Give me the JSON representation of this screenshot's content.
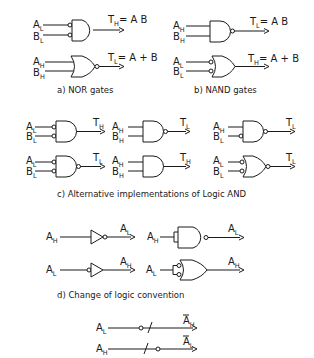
{
  "figure": {
    "sections": {
      "a": {
        "caption": "a)  NOR gates",
        "gates": [
          {
            "type": "AND",
            "inputs": [
              {
                "name": "A",
                "level": "L"
              },
              {
                "name": "B",
                "level": "L"
              }
            ],
            "output": {
              "name": "T",
              "level": "H",
              "expr": "= A B"
            }
          },
          {
            "type": "NOR",
            "inputs": [
              {
                "name": "A",
                "level": "H"
              },
              {
                "name": "B",
                "level": "H"
              }
            ],
            "output": {
              "name": "T",
              "level": "L",
              "expr": "= A + B"
            }
          }
        ]
      },
      "b": {
        "caption": "b)  NAND gates",
        "gates": [
          {
            "type": "NAND",
            "inputs": [
              {
                "name": "A",
                "level": "H"
              },
              {
                "name": "B",
                "level": "H"
              }
            ],
            "output": {
              "name": "T",
              "level": "L",
              "expr": "= A B"
            }
          },
          {
            "type": "OR",
            "inputs": [
              {
                "name": "A",
                "level": "L"
              },
              {
                "name": "B",
                "level": "L"
              }
            ],
            "output": {
              "name": "T",
              "level": "H",
              "expr": "= A + B"
            }
          }
        ]
      },
      "c": {
        "caption": "c)    Alternative implementations of Logic AND",
        "gates": [
          {
            "type": "AND",
            "inputs": [
              {
                "name": "A",
                "level": "L"
              },
              {
                "name": "B",
                "level": "L"
              }
            ],
            "output": {
              "name": "T",
              "level": "H"
            }
          },
          {
            "type": "NAND",
            "inputs": [
              {
                "name": "A",
                "level": "H"
              },
              {
                "name": "B",
                "level": "H"
              }
            ],
            "output": {
              "name": "T",
              "level": "L"
            }
          },
          {
            "type": "NAND",
            "inputs": [
              {
                "name": "A",
                "level": "H"
              },
              {
                "name": "B",
                "level": "L"
              }
            ],
            "output": {
              "name": "T",
              "level": "L"
            }
          },
          {
            "type": "NAND",
            "inputs": [
              {
                "name": "A",
                "level": "L"
              },
              {
                "name": "B",
                "level": "L"
              }
            ],
            "output": {
              "name": "T",
              "level": "L"
            }
          },
          {
            "type": "AND",
            "inputs": [
              {
                "name": "A",
                "level": "H"
              },
              {
                "name": "B",
                "level": "H"
              }
            ],
            "output": {
              "name": "T",
              "level": "H"
            }
          },
          {
            "type": "NOR",
            "inputs": [
              {
                "name": "A",
                "level": "L"
              },
              {
                "name": "B",
                "level": "L"
              }
            ],
            "output": {
              "name": "T",
              "level": "L"
            }
          }
        ]
      },
      "d": {
        "caption": "d)   Change of logic convention",
        "gates": [
          {
            "type": "INVERTER",
            "input": {
              "name": "A",
              "level": "H"
            },
            "output": {
              "name": "A",
              "level": "L"
            }
          },
          {
            "type": "NAND",
            "input": {
              "name": "A",
              "level": "H"
            },
            "output": {
              "name": "A",
              "level": "L"
            }
          },
          {
            "type": "BUFFER",
            "input": {
              "name": "A",
              "level": "L"
            },
            "output": {
              "name": "A",
              "level": "H"
            }
          },
          {
            "type": "OR",
            "input": {
              "name": "A",
              "level": "L"
            },
            "output": {
              "name": "A",
              "level": "H"
            }
          }
        ]
      },
      "e": {
        "lines": [
          {
            "input": {
              "name": "A",
              "level": "L"
            },
            "output": {
              "name": "A",
              "level": "H",
              "bar": true
            }
          },
          {
            "input": {
              "name": "A",
              "level": "H"
            },
            "output": {
              "name": "A",
              "level": "L",
              "bar": true
            }
          }
        ]
      }
    }
  }
}
